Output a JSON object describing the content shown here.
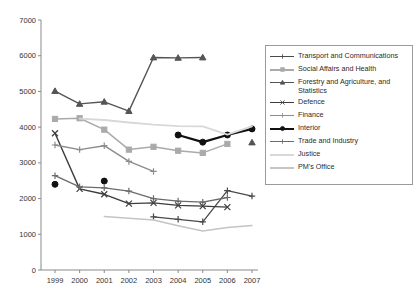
{
  "chart_data": {
    "type": "line",
    "title": "",
    "xlabel": "",
    "ylabel": "",
    "categories": [
      1999,
      2000,
      2001,
      2002,
      2003,
      2004,
      2005,
      2006,
      2007
    ],
    "x": [
      "1999",
      "2000",
      "2001",
      "2002",
      "2003",
      "2004",
      "2005",
      "2006",
      "2007"
    ],
    "ylim": [
      0,
      7000
    ],
    "yticks": [
      "0",
      "1000",
      "2000",
      "3000",
      "4000",
      "5000",
      "6000",
      "7000"
    ],
    "ytick_values": [
      0,
      1000,
      2000,
      3000,
      4000,
      5000,
      6000,
      7000
    ],
    "grid": false,
    "legend_position": "right",
    "series": [
      {
        "name": "Transport and Communications",
        "color": "#4a4a4a",
        "marker": "plus",
        "width": 1.3,
        "values": [
          null,
          null,
          null,
          null,
          1490,
          1420,
          1350,
          2220,
          2070
        ]
      },
      {
        "name": "Social Affairs and Health",
        "color": "#aaaaaa",
        "marker": "square",
        "width": 1.5,
        "values": [
          4230,
          4250,
          3930,
          3370,
          3450,
          3340,
          3280,
          3530,
          null
        ]
      },
      {
        "name": "Forestry and Agriculture, and Statistics",
        "color": "#555555",
        "marker": "triangle",
        "width": 1.4,
        "values": [
          5010,
          4650,
          4710,
          4450,
          5950,
          5940,
          5950,
          null,
          3570
        ]
      },
      {
        "name": "Defence",
        "color": "#3d3d3d",
        "marker": "x",
        "width": 1.4,
        "values": [
          3830,
          2270,
          2120,
          1860,
          1880,
          1810,
          1790,
          1760,
          null
        ]
      },
      {
        "name": "Finance",
        "color": "#8c8c8c",
        "marker": "plus",
        "width": 1.4,
        "values": [
          3500,
          3370,
          3480,
          3040,
          2760,
          null,
          null,
          null,
          null
        ]
      },
      {
        "name": "Interior",
        "color": "#111111",
        "marker": "circle",
        "width": 2.3,
        "values": [
          2400,
          null,
          2490,
          null,
          null,
          3780,
          3580,
          3780,
          3950
        ]
      },
      {
        "name": "Trade and Industry",
        "color": "#6b6b6b",
        "marker": "plus",
        "width": 1.3,
        "values": [
          2640,
          2330,
          2300,
          2210,
          2000,
          1930,
          1900,
          2030,
          null
        ]
      },
      {
        "name": "Justice",
        "color": "#d8d8d8",
        "marker": "none",
        "width": 1.8,
        "values": [
          null,
          4240,
          4200,
          4130,
          4070,
          4030,
          4020,
          3790,
          4020
        ]
      },
      {
        "name": "PM's Office",
        "color": "#c4c4c4",
        "marker": "none",
        "width": 1.5,
        "values": [
          null,
          null,
          1500,
          1450,
          1400,
          1240,
          1090,
          1190,
          1250
        ]
      }
    ]
  },
  "legend": {
    "items": [
      {
        "label": "Transport and Communications"
      },
      {
        "label": "Social Affairs and Health"
      },
      {
        "label": "Forestry and Agriculture, and\nStatistics"
      },
      {
        "label": "Defence"
      },
      {
        "label": "Finance"
      },
      {
        "label": "Interior"
      },
      {
        "label": "Trade and Industry"
      },
      {
        "label": "Justice"
      },
      {
        "label": "PM's Office"
      }
    ]
  }
}
